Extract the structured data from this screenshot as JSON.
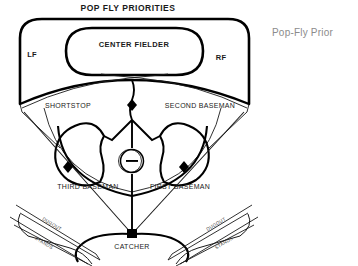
{
  "diagram": {
    "title": "POP FLY PRIORITIES",
    "side_note": "Pop-Fly Prior",
    "zones": {
      "center_fielder": "CENTER FIELDER",
      "left_field": "LF",
      "right_field": "RF"
    },
    "positions": {
      "shortstop": "SHORTSTOP",
      "second_baseman": "SECOND BASEMAN",
      "third_baseman": "THIRD BASEMAN",
      "first_baseman": "FIRST BASEMAN",
      "catcher": "CATCHER"
    },
    "facilities": {
      "dugout_left": "DUGOUT",
      "stands_left": "STANDS",
      "dugout_right": "DUGOUT",
      "stands_right": "STANDS"
    },
    "markers": {
      "second_base": "second-base-diamond",
      "third_base": "third-base-diamond",
      "first_base": "first-base-diamond",
      "home_plate": "home-plate-square",
      "pitchers_mound": "pitchers-mound-circle"
    },
    "colors": {
      "ink": "#000000",
      "thin_ink": "#1a1a1a",
      "side_note": "#8b8b8b",
      "background": "#ffffff"
    }
  }
}
